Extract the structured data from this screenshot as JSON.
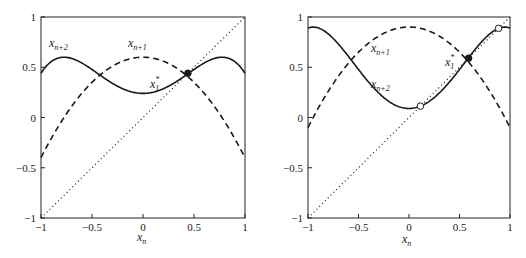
{
  "chart_data": [
    {
      "type": "line",
      "panel": "left",
      "title": "",
      "xlabel": "x_n",
      "ylabel": "",
      "xlim": [
        -1,
        1
      ],
      "ylim": [
        -1,
        1
      ],
      "xticks": [
        -1,
        -0.5,
        0,
        0.5,
        1
      ],
      "yticks": [
        -1,
        -0.5,
        0,
        0.5,
        1
      ],
      "xtick_labels": [
        "-1",
        "-0.5",
        "0",
        "0.5",
        "1"
      ],
      "ytick_labels": [
        "-1",
        "-0.5",
        "0",
        "0.5",
        "1"
      ],
      "grid": false,
      "map_parameter_a": 0.6,
      "map_formula": "x_{n+1} = a - x_n^2",
      "series": [
        {
          "name": "x_{n+1}",
          "style": "dashed",
          "x": [
            -1,
            -0.75,
            -0.5,
            -0.25,
            0,
            0.25,
            0.5,
            0.75,
            1
          ],
          "values": [
            -0.4,
            0.0375,
            0.35,
            0.5375,
            0.6,
            0.5375,
            0.35,
            0.0375,
            -0.4
          ]
        },
        {
          "name": "x_{n+2}",
          "style": "solid",
          "x": [
            -1,
            -0.75,
            -0.5,
            -0.25,
            0,
            0.25,
            0.5,
            0.75,
            1
          ],
          "values": [
            0.44,
            0.5986,
            0.4775,
            0.311,
            0.24,
            0.311,
            0.4775,
            0.5986,
            0.44
          ]
        },
        {
          "name": "identity",
          "style": "dotted",
          "x": [
            -1,
            1
          ],
          "values": [
            -1,
            1
          ]
        }
      ],
      "annotations": [
        {
          "label": "x_1^*",
          "type": "fixed-point",
          "x": 0.44,
          "y": 0.44,
          "marker": "filled-circle"
        }
      ]
    },
    {
      "type": "line",
      "panel": "right",
      "title": "",
      "xlabel": "x_n",
      "ylabel": "",
      "xlim": [
        -1,
        1
      ],
      "ylim": [
        -1,
        1
      ],
      "xticks": [
        -1,
        -0.5,
        0,
        0.5,
        1
      ],
      "yticks": [
        -1,
        -0.5,
        0,
        0.5,
        1
      ],
      "xtick_labels": [
        "-1",
        "-0.5",
        "0",
        "0.5",
        "1"
      ],
      "ytick_labels": [
        "-1",
        "-0.5",
        "0",
        "0.5",
        "1"
      ],
      "grid": false,
      "map_parameter_a": 0.9,
      "map_formula": "x_{n+1} = a - x_n^2",
      "series": [
        {
          "name": "x_{n+1}",
          "style": "dashed",
          "x": [
            -1,
            -0.75,
            -0.5,
            -0.25,
            0,
            0.25,
            0.5,
            0.75,
            1
          ],
          "values": [
            -0.1,
            0.3375,
            0.65,
            0.8375,
            0.9,
            0.8375,
            0.65,
            0.3375,
            -0.1
          ]
        },
        {
          "name": "x_{n+2}",
          "style": "solid",
          "x": [
            -1,
            -0.75,
            -0.5,
            -0.25,
            0,
            0.25,
            0.5,
            0.75,
            1
          ],
          "values": [
            0.89,
            0.7861,
            0.4775,
            0.1986,
            0.09,
            0.1986,
            0.4775,
            0.7861,
            0.89
          ]
        },
        {
          "name": "identity",
          "style": "dotted",
          "x": [
            -1,
            1
          ],
          "values": [
            -1,
            1
          ]
        }
      ],
      "annotations": [
        {
          "label": "x_1^*",
          "type": "fixed-point",
          "x": 0.59,
          "y": 0.59,
          "marker": "filled-circle"
        },
        {
          "label": "",
          "type": "2-cycle-point",
          "x": 0.113,
          "y": 0.113,
          "marker": "open-circle"
        },
        {
          "label": "",
          "type": "2-cycle-point",
          "x": 0.887,
          "y": 0.887,
          "marker": "open-circle"
        }
      ]
    }
  ],
  "panels": {
    "left": {
      "xlabel": "x",
      "xlabel_sub": "n",
      "label_xn2": "x",
      "label_xn2_sub": "n+2",
      "label_xn1": "x",
      "label_xn1_sub": "n+1",
      "label_fp": "x",
      "label_fp_sub": "1",
      "label_fp_sup": "*"
    },
    "right": {
      "xlabel": "x",
      "xlabel_sub": "n",
      "label_xn2": "x",
      "label_xn2_sub": "n+2",
      "label_xn1": "x",
      "label_xn1_sub": "n+1",
      "label_fp": "x",
      "label_fp_sub": "1",
      "label_fp_sup": "*"
    }
  }
}
